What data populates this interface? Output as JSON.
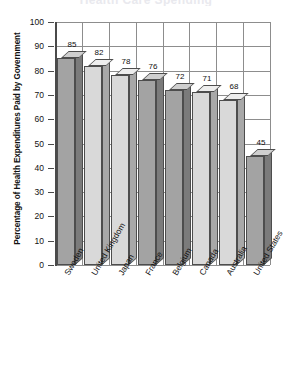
{
  "chart_data": {
    "type": "bar",
    "title": "Health Care Spending",
    "xlabel": "",
    "ylabel": "Percentage of Health Expenditures Paid by Government",
    "ylim": [
      0,
      100
    ],
    "ytick_step": 10,
    "yticks": [
      100,
      90,
      80,
      70,
      60,
      50,
      40,
      30,
      20,
      10,
      0
    ],
    "grid": "both",
    "legend": "none",
    "categories": [
      "Sweden",
      "United Kingdom",
      "Japan",
      "France",
      "Belgium",
      "Canada",
      "Australia",
      "United States"
    ],
    "values": [
      85,
      82,
      78,
      76,
      72,
      71,
      68,
      45
    ],
    "bar_shades": [
      "dark",
      "light",
      "light",
      "dark",
      "dark",
      "light",
      "light",
      "dark"
    ],
    "colors": {
      "bar_dark_front": "#a3a3a3",
      "bar_dark_top": "#cfcfcf",
      "bar_dark_side": "#7b7b7b",
      "bar_light_front": "#d9d9d9",
      "bar_light_top": "#eeeeee",
      "bar_light_side": "#a8a8a8",
      "gridline": "#8d8d8d",
      "axis": "#4a4a4a",
      "background": "#ffffff",
      "text": "#111111"
    }
  }
}
